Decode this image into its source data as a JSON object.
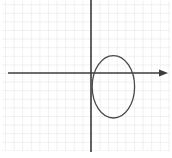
{
  "figure": {
    "title": "Ellipse plotted on graph paper",
    "width": 172,
    "height": 158,
    "background_color": "#ffffff"
  },
  "grid": {
    "label": "graph-paper-grid",
    "spacing_px": 8.6,
    "minor_color": "#c9c9c9",
    "minor_width_px": 0.6,
    "visible": true,
    "extent": {
      "left_px": 2,
      "top_px": 1,
      "right_px": 170,
      "bottom_px": 151
    }
  },
  "axes": {
    "x_axis": {
      "label": "x",
      "name": "x-axis",
      "color": "#3c3c3c",
      "width_px": 1.6,
      "y_px": 73,
      "start_px": 8,
      "end_px": 168,
      "arrow": "right",
      "arrow_tip_px": 168
    },
    "y_axis": {
      "label": "y",
      "name": "y-axis",
      "color": "#3c3c3c",
      "width_px": 1.6,
      "x_px": 91,
      "start_px": 0,
      "end_px": 152,
      "arrow": "none"
    },
    "origin": {
      "x_px": 91,
      "y_px": 73
    },
    "tick_labels": [],
    "axis_numbers_visible": false
  },
  "chart_data": {
    "type": "scatter",
    "title": "",
    "subtitle": "",
    "xlabel": "x",
    "ylabel": "",
    "grid": true,
    "legend_position": "none",
    "legend_entries": [],
    "annotations": [],
    "xlim": [
      -10.3,
      9.2
    ],
    "ylim": [
      -9.2,
      8.5
    ],
    "x_tick_step": 1,
    "y_tick_step": 1,
    "series": [
      {
        "name": "ellipse",
        "type": "ellipse",
        "color": "#4a4a4a",
        "line_width_px": 1.3,
        "fill": "none",
        "center": {
          "x": 2.6,
          "y": -1.6
        },
        "center_px": {
          "x": 113.4,
          "y": 86.8
        },
        "semi_axis_x": 2.45,
        "semi_axis_y": 3.6,
        "semi_axis_x_px": 21.2,
        "semi_axis_y_px": 31.2,
        "rotation_deg": 0,
        "x_range": [
          0.15,
          5.05
        ],
        "y_range": [
          -5.2,
          2.0
        ],
        "x_range_px": [
          92.2,
          134.6
        ],
        "y_range_px": [
          55.6,
          118.0
        ],
        "points": [
          {
            "x": 5.05,
            "y": -1.6
          },
          {
            "x": 4.33,
            "y": 0.95
          },
          {
            "x": 2.6,
            "y": 2.0
          },
          {
            "x": 0.87,
            "y": 0.95
          },
          {
            "x": 0.15,
            "y": -1.6
          },
          {
            "x": 0.87,
            "y": -4.15
          },
          {
            "x": 2.6,
            "y": -5.2
          },
          {
            "x": 4.33,
            "y": -4.15
          }
        ]
      }
    ]
  },
  "colors": {
    "ink": "#3c3c3c",
    "curve": "#4a4a4a",
    "grid_minor": "#c9c9c9",
    "paper": "#ffffff"
  }
}
